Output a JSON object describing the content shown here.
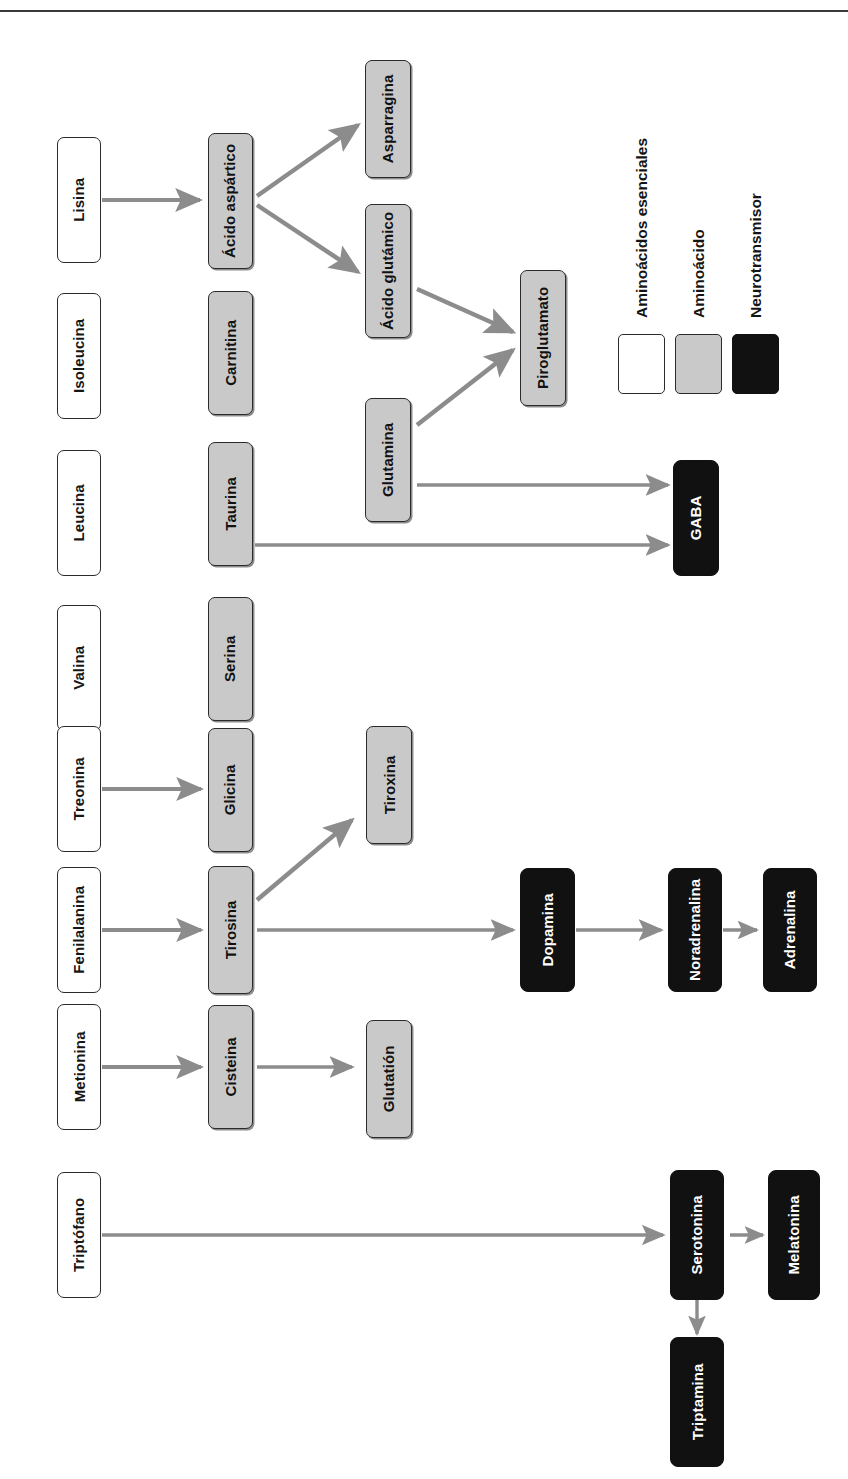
{
  "diagram": {
    "orientation": "rotated-90",
    "colors": {
      "essential_amino_acid": "#FFFFFF",
      "amino_acid": "#C9C9C9",
      "neurotransmitter": "#111111",
      "arrow": "#8C8C8C",
      "border": "#2B2B2B"
    }
  },
  "legend": {
    "items": [
      {
        "label": "Aminoácidos esenciales",
        "swatch": "white",
        "type": "essential_amino_acid"
      },
      {
        "label": "Aminoácido",
        "swatch": "gray",
        "type": "amino_acid"
      },
      {
        "label": "Neurotransmisor",
        "swatch": "black",
        "type": "neurotransmitter"
      }
    ]
  },
  "nodes": {
    "essential": [
      {
        "id": "lisina",
        "label": "Lisina"
      },
      {
        "id": "isoleucina",
        "label": "Isoleucina"
      },
      {
        "id": "leucina",
        "label": "Leucina"
      },
      {
        "id": "valina",
        "label": "Valina"
      },
      {
        "id": "treonina",
        "label": "Treonina"
      },
      {
        "id": "fenilalanina",
        "label": "Fenilalanina"
      },
      {
        "id": "metionina",
        "label": "Metionina"
      },
      {
        "id": "triptofano",
        "label": "Triptófano"
      }
    ],
    "amino": [
      {
        "id": "acido-aspartico",
        "label": "Ácido aspártico"
      },
      {
        "id": "carnitina",
        "label": "Carnitina"
      },
      {
        "id": "taurina",
        "label": "Taurina"
      },
      {
        "id": "serina",
        "label": "Serina"
      },
      {
        "id": "glicina",
        "label": "Glicina"
      },
      {
        "id": "tirosina",
        "label": "Tirosina"
      },
      {
        "id": "cisteina",
        "label": "Cisteina"
      },
      {
        "id": "asparragina",
        "label": "Asparragina"
      },
      {
        "id": "acido-glutamico",
        "label": "Ácido glutámico"
      },
      {
        "id": "glutamina",
        "label": "Glutamina"
      },
      {
        "id": "piroglutamato",
        "label": "Piroglutamato"
      },
      {
        "id": "tiroxina",
        "label": "Tiroxina"
      },
      {
        "id": "glutation",
        "label": "Glutatión"
      }
    ],
    "neurotransmitters": [
      {
        "id": "gaba",
        "label": "GABA"
      },
      {
        "id": "dopamina",
        "label": "Dopamina"
      },
      {
        "id": "noradrenalina",
        "label": "Noradrenalina"
      },
      {
        "id": "adrenalina",
        "label": "Adrenalina"
      },
      {
        "id": "serotonina",
        "label": "Serotonina"
      },
      {
        "id": "melatonina",
        "label": "Melatonina"
      },
      {
        "id": "triptamina",
        "label": "Triptamina"
      }
    ]
  },
  "edges": [
    {
      "from": "Lisina",
      "to": "Ácido aspártico"
    },
    {
      "from": "Ácido aspártico",
      "to": "Asparragina"
    },
    {
      "from": "Ácido aspártico",
      "to": "Ácido glutámico"
    },
    {
      "from": "Ácido glutámico",
      "to": "Piroglutamato"
    },
    {
      "from": "Glutamina",
      "to": "Piroglutamato"
    },
    {
      "from": "Glutamina",
      "to": "GABA"
    },
    {
      "from": "Taurina",
      "to": "GABA"
    },
    {
      "from": "Treonina",
      "to": "Glicina"
    },
    {
      "from": "Fenilalanina",
      "to": "Tirosina"
    },
    {
      "from": "Tirosina",
      "to": "Tiroxina"
    },
    {
      "from": "Tirosina",
      "to": "Dopamina"
    },
    {
      "from": "Dopamina",
      "to": "Noradrenalina"
    },
    {
      "from": "Noradrenalina",
      "to": "Adrenalina"
    },
    {
      "from": "Metionina",
      "to": "Cisteina"
    },
    {
      "from": "Cisteina",
      "to": "Glutatión"
    },
    {
      "from": "Triptófano",
      "to": "Serotonina"
    },
    {
      "from": "Serotonina",
      "to": "Melatonina"
    },
    {
      "from": "Serotonina",
      "to": "Triptamina"
    }
  ]
}
